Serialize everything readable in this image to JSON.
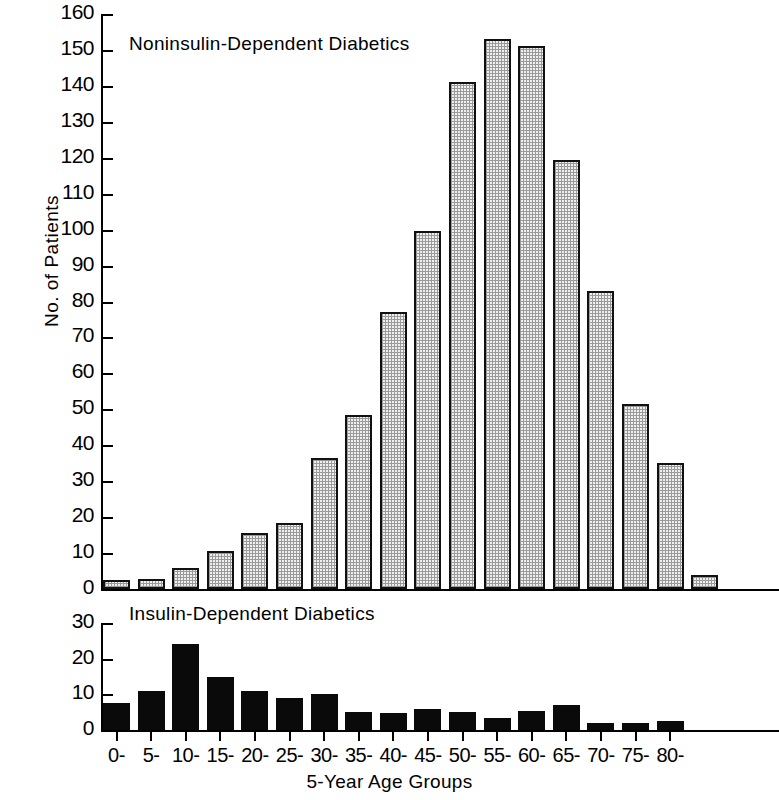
{
  "figure": {
    "ylabel": "No. of  Patients",
    "xlabel": "5-Year Age Groups"
  },
  "chart_data": {
    "type": "bar",
    "title": "",
    "xlabel": "5-Year Age Groups",
    "ylabel": "No. of Patients",
    "grid": false,
    "legend_position": "none",
    "panels": [
      {
        "name": "upper",
        "label": "Noninsulin-Dependent  Diabetics",
        "ylim": [
          0,
          160
        ],
        "yticks": [
          0,
          10,
          20,
          30,
          40,
          50,
          60,
          70,
          80,
          90,
          100,
          110,
          120,
          130,
          140,
          150,
          160
        ],
        "fill": "hatched",
        "categories": [
          "0-",
          "5-",
          "10-",
          "15-",
          "20-",
          "25-",
          "30-",
          "35-",
          "40-",
          "45-",
          "50-",
          "55-",
          "60-",
          "65-",
          "70-",
          "75-",
          "80-"
        ],
        "values": [
          2.5,
          2.8,
          5.8,
          10.5,
          15.5,
          18.5,
          36.5,
          48.5,
          77,
          99.5,
          141,
          153,
          151,
          119.5,
          83,
          51.5,
          35
        ],
        "extra_partial_bar": 4
      },
      {
        "name": "lower",
        "label": "Insulin-Dependent  Diabetics",
        "ylim": [
          0,
          30
        ],
        "yticks": [
          0,
          10,
          20,
          30
        ],
        "fill": "solid",
        "categories": [
          "0-",
          "5-",
          "10-",
          "15-",
          "20-",
          "25-",
          "30-",
          "35-",
          "40-",
          "45-",
          "50-",
          "55-",
          "60-",
          "65-",
          "70-",
          "75-",
          "80-"
        ],
        "values": [
          7.5,
          11,
          24,
          14.8,
          10.8,
          9,
          10,
          5,
          4.8,
          6,
          5,
          3.4,
          5.2,
          7,
          2,
          2,
          2.6
        ]
      }
    ]
  },
  "upper_yticks": [
    {
      "v": 160
    },
    {
      "v": 150
    },
    {
      "v": 140
    },
    {
      "v": 130
    },
    {
      "v": 120
    },
    {
      "v": 110
    },
    {
      "v": 100
    },
    {
      "v": 90
    },
    {
      "v": 80
    },
    {
      "v": 70
    },
    {
      "v": 60
    },
    {
      "v": 50
    },
    {
      "v": 40
    },
    {
      "v": 30
    },
    {
      "v": 20
    },
    {
      "v": 10
    },
    {
      "v": 0
    }
  ],
  "lower_yticks": [
    {
      "v": 30
    },
    {
      "v": 20
    },
    {
      "v": 10
    },
    {
      "v": 0
    }
  ]
}
